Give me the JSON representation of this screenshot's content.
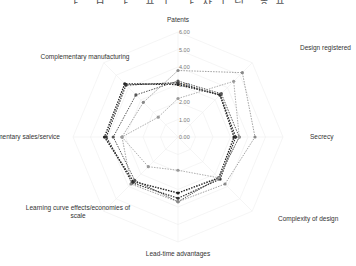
{
  "header": {
    "cut_title": "ㅏ ㅂ ㅏ 프ㅗ ㅏ자ㅣ님 ㅎ프ㅡ ㅏ자ㅣ톤 ㅓ프"
  },
  "chart_data": {
    "type": "radar",
    "title": "",
    "axes": [
      "Patents",
      "Design registered",
      "Secrecy",
      "Complexity of design",
      "Lead-time advantages",
      "Learning curve effects/economies of scale",
      "Complementary sales/service",
      "Complementary manufacturing"
    ],
    "axis_label_lines": [
      [
        "Patents"
      ],
      [
        "Design registered"
      ],
      [
        "Secrecy"
      ],
      [
        "Complexity of design"
      ],
      [
        "Lead-time advantages"
      ],
      [
        "Learning curve effects/economies of",
        "scale"
      ],
      [
        "Complementary sales/service"
      ],
      [
        "Complementary manufacturing"
      ]
    ],
    "rlim": [
      0,
      6
    ],
    "ticks": [
      "0.00",
      "1.00",
      "2.00",
      "3.00",
      "4.00",
      "5.00",
      "6.00"
    ],
    "grid": true,
    "legend": "none",
    "series": [
      {
        "name": "Series 1",
        "color": "#222222",
        "width": 1.4,
        "values": [
          3.0,
          3.4,
          3.2,
          3.3,
          3.2,
          3.6,
          4.2,
          4.3
        ]
      },
      {
        "name": "Series 2",
        "color": "#333333",
        "width": 1.2,
        "values": [
          3.1,
          3.4,
          3.3,
          3.4,
          3.5,
          3.7,
          4.1,
          4.2
        ]
      },
      {
        "name": "Series 3",
        "color": "#555555",
        "width": 1.0,
        "values": [
          3.2,
          3.5,
          3.5,
          3.3,
          3.7,
          3.5,
          3.7,
          3.4
        ]
      },
      {
        "name": "Series 4",
        "color": "#888888",
        "width": 0.8,
        "values": [
          3.8,
          5.2,
          4.4,
          3.8,
          3.7,
          3.8,
          3.2,
          2.8
        ]
      },
      {
        "name": "Series 5",
        "color": "#999999",
        "width": 0.8,
        "values": [
          2.2,
          4.5,
          3.5,
          3.3,
          1.9,
          2.4,
          3.2,
          1.6
        ]
      }
    ]
  }
}
